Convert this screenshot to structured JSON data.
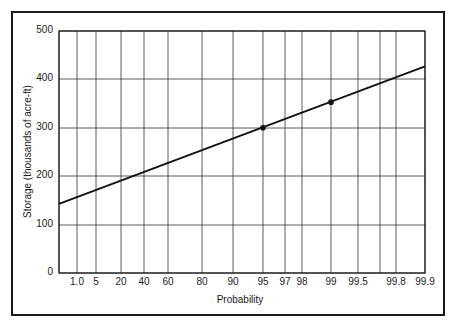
{
  "chart_data": {
    "type": "line",
    "title": "",
    "xlabel": "Probability",
    "ylabel": "Storage (thousands of acre-ft)",
    "x_scale": "normal-probability",
    "x_ticks": [
      "1.0",
      "5",
      "20",
      "40",
      "60",
      "80",
      "90",
      "95",
      "97",
      "98",
      "99",
      "99.5",
      "99.8",
      "99.9"
    ],
    "y_ticks": [
      "0",
      "100",
      "200",
      "300",
      "400",
      "500"
    ],
    "ylim": [
      0,
      500
    ],
    "grid": true,
    "legend": null,
    "series": [
      {
        "name": "Fitted line",
        "style": "line",
        "x": [
          "left edge",
          "99.8",
          "right edge (99.9)"
        ],
        "values": [
          143,
          400,
          427
        ]
      },
      {
        "name": "Data points",
        "style": "markers",
        "x": [
          "95",
          "99"
        ],
        "values": [
          300,
          353
        ]
      }
    ]
  },
  "plot": {
    "x_positions": [
      77,
      96,
      121,
      144,
      168,
      202,
      233,
      263,
      285,
      302,
      331,
      358,
      396,
      425
    ],
    "grid_x": [
      59,
      77,
      96,
      121,
      144,
      168,
      202,
      233,
      263,
      285,
      302,
      331,
      358,
      380,
      396,
      425
    ],
    "y_positions": [
      273,
      225,
      176,
      128,
      79,
      31
    ]
  }
}
